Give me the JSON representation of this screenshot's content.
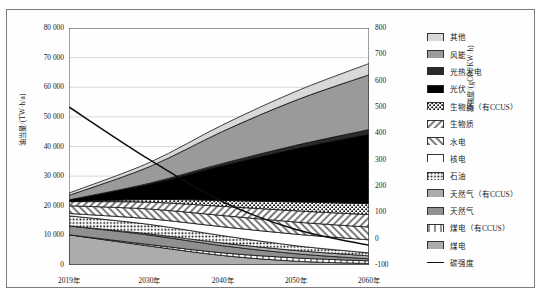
{
  "axes": {
    "y_left_title": "油当量/(TW·h/a)",
    "y_right_title": "碳强度/(gCO₂/KW·h)",
    "y_left_ticks": [
      "80 000",
      "70 000",
      "60 000",
      "50 000",
      "40 000",
      "30 000",
      "20 000",
      "10 000",
      "0"
    ],
    "y_right_ticks": [
      "800",
      "700",
      "600",
      "500",
      "400",
      "300",
      "200",
      "100",
      "0",
      "-100"
    ],
    "x_ticks": [
      "2019年",
      "2030年",
      "2040年",
      "2050年",
      "2060年"
    ]
  },
  "legend": {
    "items": [
      {
        "label": "其他",
        "key": "other",
        "pattern": "solid-light"
      },
      {
        "label": "风能",
        "key": "wind",
        "pattern": "solid-mid"
      },
      {
        "label": "光热发电",
        "key": "csp",
        "pattern": "solid-dark"
      },
      {
        "label": "光伏",
        "key": "pv",
        "pattern": "solid-black"
      },
      {
        "label": "生物质（有CCUS）",
        "key": "biomass-ccus",
        "pattern": "dots-dense"
      },
      {
        "label": "生物质",
        "key": "biomass",
        "pattern": "diag-right"
      },
      {
        "label": "水电",
        "key": "hydro",
        "pattern": "diag-left"
      },
      {
        "label": "核电",
        "key": "nuclear",
        "pattern": "empty"
      },
      {
        "label": "石油",
        "key": "oil",
        "pattern": "dots-grid"
      },
      {
        "label": "天然气（有CCUS）",
        "key": "gas-ccus",
        "pattern": "horiz"
      },
      {
        "label": "天然气",
        "key": "gas",
        "pattern": "grid"
      },
      {
        "label": "煤电（有CCUS）",
        "key": "coal-ccus",
        "pattern": "vert-wide"
      },
      {
        "label": "煤电",
        "key": "coal",
        "pattern": "vert"
      },
      {
        "label": "碳强度",
        "key": "carbon-intensity",
        "pattern": "line"
      }
    ]
  },
  "chart_data": {
    "type": "area",
    "title": "",
    "xlabel": "",
    "ylabel": "油当量/(TW·h/a)",
    "y2label": "碳强度/(gCO₂/KW·h)",
    "x": [
      2019,
      2030,
      2040,
      2050,
      2060
    ],
    "xlim": [
      2019,
      2060
    ],
    "ylim": [
      0,
      80000
    ],
    "y2lim": [
      -100,
      800
    ],
    "grid": true,
    "legend_position": "right",
    "stack_order_bottom_to_top": [
      "coal",
      "coal-ccus",
      "gas",
      "gas-ccus",
      "oil",
      "nuclear",
      "hydro",
      "biomass",
      "biomass-ccus",
      "pv",
      "csp",
      "wind",
      "other"
    ],
    "series": [
      {
        "name": "煤电",
        "key": "coal",
        "values": [
          10200,
          6400,
          3200,
          1300,
          500
        ]
      },
      {
        "name": "煤电（有CCUS）",
        "key": "coal-ccus",
        "values": [
          0,
          500,
          900,
          1100,
          900
        ]
      },
      {
        "name": "天然气",
        "key": "gas",
        "values": [
          3000,
          3200,
          2400,
          1400,
          700
        ]
      },
      {
        "name": "天然气（有CCUS）",
        "key": "gas-ccus",
        "values": [
          0,
          400,
          900,
          1100,
          1000
        ]
      },
      {
        "name": "石油",
        "key": "oil",
        "values": [
          3400,
          3200,
          2500,
          1600,
          1000
        ]
      },
      {
        "name": "核电",
        "key": "nuclear",
        "values": [
          800,
          1900,
          3000,
          3900,
          4400
        ]
      },
      {
        "name": "水电",
        "key": "hydro",
        "values": [
          2600,
          3300,
          3800,
          4100,
          4300
        ]
      },
      {
        "name": "生物质",
        "key": "biomass",
        "values": [
          1400,
          2300,
          3100,
          3800,
          4200
        ]
      },
      {
        "name": "生物质（有CCUS）",
        "key": "biomass-ccus",
        "values": [
          0,
          900,
          2000,
          3000,
          3700
        ]
      },
      {
        "name": "光伏",
        "key": "pv",
        "values": [
          600,
          5200,
          11800,
          18000,
          23500
        ]
      },
      {
        "name": "光热发电",
        "key": "csp",
        "values": [
          0,
          300,
          700,
          1100,
          1500
        ]
      },
      {
        "name": "风能",
        "key": "wind",
        "values": [
          1500,
          5600,
          10800,
          15200,
          18500
        ]
      },
      {
        "name": "其他",
        "key": "other",
        "values": [
          800,
          1400,
          2200,
          3000,
          3800
        ]
      }
    ],
    "line_series": {
      "name": "碳强度",
      "key": "carbon-intensity",
      "axis": "y2",
      "x": [
        2019,
        2030,
        2040,
        2050,
        2060
      ],
      "values": [
        500,
        300,
        140,
        35,
        -25
      ],
      "unit": "gCO₂/KW·h"
    }
  }
}
